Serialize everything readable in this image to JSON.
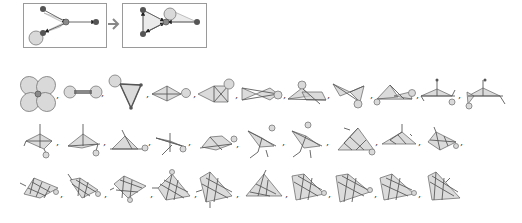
{
  "figure": {
    "rule": {
      "left_graph": {
        "frame": [
          23,
          3,
          83,
          44
        ]
      },
      "right_graph": {
        "frame": [
          122,
          3,
          84,
          44
        ]
      },
      "arrow_symbol": "→"
    },
    "separator": ",",
    "rows": [
      {
        "y": 94,
        "count": 11,
        "x_positions": [
          38,
          80,
          127,
          170,
          218,
          262,
          307,
          350,
          392,
          436,
          478
        ]
      },
      {
        "y": 141,
        "count": 11,
        "x_positions": [
          38,
          82,
          124,
          165,
          212,
          260,
          306,
          352,
          395,
          440,
          480
        ]
      },
      {
        "y": 193,
        "count": 11,
        "x_positions": [
          40,
          84,
          128,
          172,
          215,
          262,
          306,
          350,
          394,
          438,
          482
        ]
      }
    ],
    "colors": {
      "node": "#555555",
      "hub_node": "#8a8a8a",
      "face_fill": "#cfcfcf",
      "edge": "#5a5a5a",
      "frame": "#9a9a9a",
      "step_arrow": "#888888"
    }
  }
}
